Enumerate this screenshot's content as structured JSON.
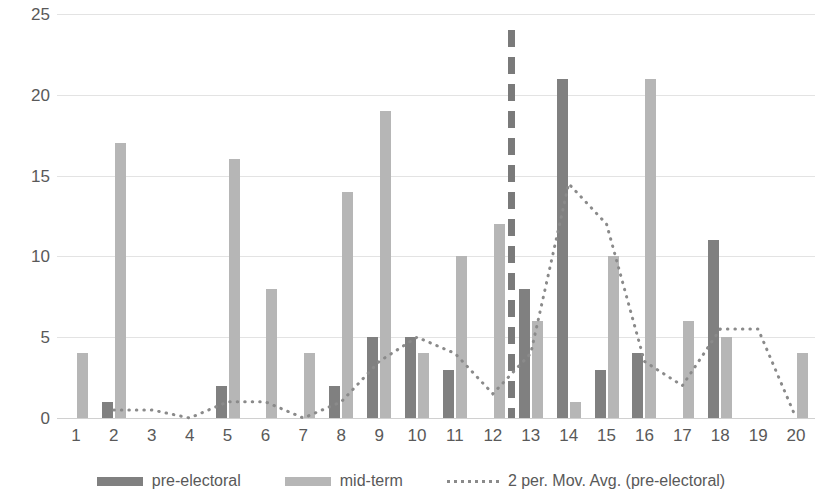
{
  "chart_data": {
    "type": "bar",
    "title": "",
    "subtitle": "",
    "xlabel": "",
    "ylabel": "",
    "ylim": [
      0,
      25
    ],
    "ytick_labels": [
      "0",
      "5",
      "10",
      "15",
      "20",
      "25"
    ],
    "ytick_values": [
      0,
      5,
      10,
      15,
      20,
      25
    ],
    "grid": true,
    "legend_position": "bottom",
    "categories": [
      "1",
      "2",
      "3",
      "4",
      "5",
      "6",
      "7",
      "8",
      "9",
      "10",
      "11",
      "12",
      "13",
      "14",
      "15",
      "16",
      "17",
      "18",
      "19",
      "20"
    ],
    "series": [
      {
        "name": "pre-electoral",
        "type": "bar",
        "color": "#808080",
        "values": [
          0,
          1,
          0,
          0,
          2,
          0,
          0,
          2,
          5,
          5,
          3,
          0,
          8,
          21,
          3,
          4,
          0,
          11,
          0,
          0
        ]
      },
      {
        "name": "mid-term",
        "type": "bar",
        "color": "#b6b6b6",
        "values": [
          4,
          17,
          0,
          0,
          16,
          8,
          4,
          14,
          19,
          4,
          10,
          12,
          6,
          1,
          10,
          21,
          6,
          5,
          0,
          4
        ]
      },
      {
        "name": "2 per. Mov. Avg. (pre-electoral)",
        "type": "line",
        "style": "dotted",
        "color": "#8a8a8a",
        "values": [
          null,
          0.5,
          0.5,
          0,
          1,
          1,
          0,
          1,
          3.5,
          5,
          4,
          1.5,
          4,
          14.5,
          12,
          3.5,
          2,
          5.5,
          5.5,
          0
        ]
      }
    ],
    "annotations": [
      {
        "name": "vertical-divider",
        "type": "vertical-dashed-line",
        "x_category_between": [
          "12",
          "13"
        ],
        "y_top": 24,
        "y_bottom": 0,
        "color": "#7a7a7a"
      }
    ]
  },
  "legend": {
    "items": [
      {
        "label": "pre-electoral",
        "marker": "bar-swatch-dark"
      },
      {
        "label": "mid-term",
        "marker": "bar-swatch-light"
      },
      {
        "label": "2 per. Mov. Avg. (pre-electoral)",
        "marker": "dotted-line-swatch"
      }
    ]
  }
}
